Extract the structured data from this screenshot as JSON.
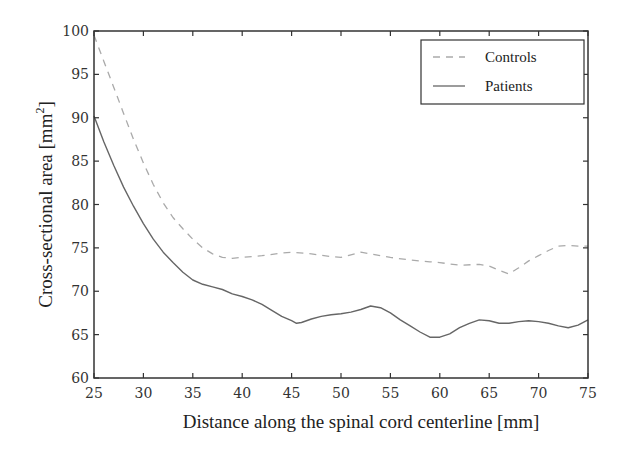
{
  "chart_data": {
    "type": "line",
    "title": "",
    "xlabel": "Distance along the spinal cord centerline [mm]",
    "ylabel": "Cross-sectional area [mm",
    "ylabel_superscript": "2",
    "ylabel_suffix": "]",
    "xlim": [
      25,
      75
    ],
    "ylim": [
      60,
      100
    ],
    "xticks": [
      25,
      30,
      35,
      40,
      45,
      50,
      55,
      60,
      65,
      70,
      75
    ],
    "yticks": [
      60,
      65,
      70,
      75,
      80,
      85,
      90,
      95,
      100
    ],
    "grid": false,
    "legend_position": "top-right",
    "series": [
      {
        "name": "Controls",
        "style": "dashed",
        "color": "#aaaaaa",
        "x": [
          25,
          26,
          27,
          28,
          29,
          30,
          31,
          32,
          33,
          34,
          35,
          36,
          37,
          38,
          39,
          40,
          42,
          44,
          45,
          47,
          49,
          50,
          51,
          52,
          53,
          55,
          57,
          59,
          60,
          62,
          64,
          65,
          66,
          67,
          68,
          69,
          70,
          71,
          72,
          73,
          74,
          75
        ],
        "y": [
          99.5,
          96.5,
          93.5,
          90.5,
          87.5,
          84.8,
          82.3,
          80.2,
          78.5,
          77.2,
          76.0,
          75.0,
          74.3,
          73.9,
          73.8,
          73.9,
          74.1,
          74.4,
          74.5,
          74.3,
          74.0,
          73.9,
          74.2,
          74.5,
          74.3,
          73.9,
          73.6,
          73.4,
          73.3,
          73.0,
          73.1,
          72.9,
          72.4,
          72.0,
          72.7,
          73.5,
          74.1,
          74.7,
          75.2,
          75.3,
          75.2,
          75.2
        ]
      },
      {
        "name": "Patients",
        "style": "solid",
        "color": "#666666",
        "x": [
          25,
          26,
          27,
          28,
          29,
          30,
          31,
          32,
          33,
          34,
          35,
          36,
          37,
          38,
          39,
          40,
          41,
          42,
          43,
          44,
          45,
          45.5,
          46,
          47,
          48,
          49,
          50,
          51,
          52,
          53,
          54,
          55,
          56,
          57,
          58,
          59,
          60,
          61,
          62,
          63,
          64,
          65,
          66,
          67,
          68,
          69,
          70,
          71,
          72,
          73,
          74,
          75
        ],
        "y": [
          90.2,
          87.2,
          84.5,
          82.0,
          79.8,
          77.8,
          76.0,
          74.5,
          73.3,
          72.2,
          71.3,
          70.8,
          70.5,
          70.2,
          69.7,
          69.4,
          69.0,
          68.5,
          67.8,
          67.1,
          66.6,
          66.3,
          66.4,
          66.8,
          67.1,
          67.3,
          67.4,
          67.6,
          67.9,
          68.3,
          68.1,
          67.5,
          66.7,
          66.0,
          65.3,
          64.7,
          64.7,
          65.1,
          65.8,
          66.3,
          66.7,
          66.6,
          66.3,
          66.3,
          66.5,
          66.6,
          66.5,
          66.3,
          66.0,
          65.8,
          66.1,
          66.7
        ]
      }
    ]
  }
}
